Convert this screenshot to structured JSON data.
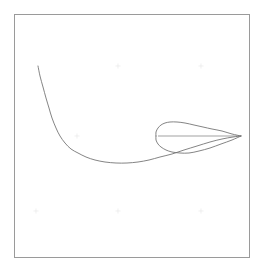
{
  "figure": {
    "title": "",
    "background_color": "#ffffff",
    "frame": {
      "name": "plot-border",
      "x": 14,
      "y": 14,
      "width": 236,
      "height": 244,
      "stroke_color": "#9a9a9a",
      "stroke_width": 1
    },
    "line_color": "#6e6e6e",
    "tick_color": "#e6e6e6"
  },
  "chart_data": {
    "type": "line",
    "title": "",
    "subtitle": "",
    "xlabel": "",
    "ylabel": "",
    "xlim": [
      14,
      250
    ],
    "ylim": [
      14,
      258
    ],
    "grid": false,
    "legend": null,
    "annotations": [],
    "xticks": [],
    "yticks": [],
    "xticklabels": [],
    "yticklabels": [],
    "series": [
      {
        "name": "separation-streamline",
        "type": "line",
        "closed": false,
        "color": "#6e6e6e",
        "points": [
          [
            38,
            66
          ],
          [
            40,
            76
          ],
          [
            43,
            87
          ],
          [
            46,
            98
          ],
          [
            49,
            108
          ],
          [
            52,
            118
          ],
          [
            56,
            128
          ],
          [
            60,
            136
          ],
          [
            65,
            143
          ],
          [
            71,
            149
          ],
          [
            78,
            153
          ],
          [
            86,
            157
          ],
          [
            95,
            160
          ],
          [
            105,
            162
          ],
          [
            116,
            163
          ],
          [
            127,
            163
          ],
          [
            138,
            162
          ],
          [
            149,
            160
          ],
          [
            160,
            157
          ],
          [
            172,
            154
          ],
          [
            184,
            150
          ],
          [
            197,
            146
          ],
          [
            210,
            142
          ],
          [
            222,
            139
          ],
          [
            233,
            137
          ],
          [
            241,
            136
          ]
        ]
      },
      {
        "name": "airfoil-upper-surface",
        "type": "line",
        "closed": false,
        "color": "#6e6e6e",
        "points": [
          [
            156,
            136
          ],
          [
            156,
            132
          ],
          [
            158,
            128
          ],
          [
            161,
            125
          ],
          [
            165,
            123
          ],
          [
            170,
            122
          ],
          [
            177,
            122
          ],
          [
            185,
            123
          ],
          [
            194,
            125
          ],
          [
            203,
            127
          ],
          [
            212,
            129
          ],
          [
            222,
            131
          ],
          [
            232,
            134
          ],
          [
            241,
            136
          ]
        ]
      },
      {
        "name": "airfoil-lower-surface",
        "type": "line",
        "closed": false,
        "color": "#6e6e6e",
        "points": [
          [
            156,
            136
          ],
          [
            156,
            140
          ],
          [
            158,
            144
          ],
          [
            161,
            147
          ],
          [
            166,
            150
          ],
          [
            172,
            152
          ],
          [
            180,
            153
          ],
          [
            189,
            153
          ],
          [
            199,
            151
          ],
          [
            210,
            148
          ],
          [
            221,
            144
          ],
          [
            232,
            140
          ],
          [
            241,
            136
          ]
        ]
      },
      {
        "name": "airfoil-chord-line",
        "type": "line",
        "closed": false,
        "color": "#7a7a7a",
        "points": [
          [
            158,
            136
          ],
          [
            241,
            136
          ]
        ]
      }
    ],
    "tick_marks": [
      {
        "name": "tick-mark",
        "x": 118,
        "y": 66
      },
      {
        "name": "tick-mark",
        "x": 201,
        "y": 66
      },
      {
        "name": "tick-mark",
        "x": 77,
        "y": 136
      },
      {
        "name": "tick-mark",
        "x": 36,
        "y": 211
      },
      {
        "name": "tick-mark",
        "x": 118,
        "y": 211
      },
      {
        "name": "tick-mark",
        "x": 201,
        "y": 211
      }
    ]
  }
}
